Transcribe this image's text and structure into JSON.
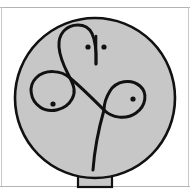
{
  "page": {
    "width": 190,
    "height": 192,
    "background_color": "#ffffff"
  },
  "frame": {
    "top_rule": {
      "label": "top horizontal rule",
      "y": 7,
      "x_start": 0,
      "x_end": 190,
      "color": "#b4b4b4",
      "thickness": 1
    },
    "bottom_rule": {
      "label": "bottom horizontal rule",
      "y": 186,
      "x_start": 0,
      "x_end": 190,
      "color": "#b4b4b4",
      "thickness": 1
    },
    "left_rule": {
      "label": "left vertical rule",
      "x": 1,
      "y_start": 7,
      "y_end": 186,
      "color": "#c8c8c8",
      "thickness": 1
    },
    "right_rule": {
      "label": "right vertical rule",
      "x": 188,
      "y_start": 7,
      "y_end": 186,
      "color": "#c8c8c8",
      "thickness": 1
    }
  },
  "figure": {
    "fill_color": "#c7c7c7",
    "stroke_color": "#111111",
    "head": {
      "label": "head circle",
      "shape": "circle",
      "center_x": 95,
      "center_y": 98,
      "radius_x": 80,
      "radius_y": 80,
      "stroke_width": 2.6
    },
    "neck": {
      "label": "neck stem rectangle",
      "shape": "rectangle",
      "x": 78,
      "y": 170,
      "width": 34,
      "height": 17,
      "stroke_width": 2.2
    },
    "curve": {
      "label": "continuous knot curve",
      "stroke_width": 3.0,
      "description": "single unbroken line forming a top arch, a left circular loop, a crossing diagonal, a right teardrop loop, and a descending tail",
      "segments": [
        {
          "name": "top-arch",
          "path": "M 96 64 C 97 34 90 25 78 25 C 66 25 58 34 59 47 C 60 60 66 70 70 78"
        },
        {
          "name": "left-loop",
          "path": "M 70 78 C 74 86 76 92 72 99 C 66 110 50 114 40 107 C 30 100 28 86 36 78 C 45 69 61 70 70 78"
        },
        {
          "name": "diagonal-connector",
          "path": "M 70 78 C 80 86 92 98 104 110"
        },
        {
          "name": "right-loop",
          "path": "M 104 110 C 112 118 126 120 136 113 C 146 106 148 93 140 86 C 131 78 116 81 110 91 C 105 99 104 105 104 110"
        },
        {
          "name": "tail",
          "path": "M 104 110 C 100 124 95 142 93 170"
        }
      ]
    },
    "vertical_stroke": {
      "label": "short vertical stroke between dots",
      "x": 96,
      "y_start": 36,
      "y_end": 64,
      "stroke_width": 2.6
    },
    "dots": [
      {
        "name": "left-eye-dot",
        "center_x": 88,
        "center_y": 47,
        "radius": 2.6
      },
      {
        "name": "right-eye-dot",
        "center_x": 104,
        "center_y": 47,
        "radius": 2.6
      },
      {
        "name": "left-loop-center-dot",
        "center_x": 53,
        "center_y": 104,
        "radius": 2.6
      },
      {
        "name": "right-loop-center-dot",
        "center_x": 133,
        "center_y": 99,
        "radius": 2.6
      }
    ]
  }
}
